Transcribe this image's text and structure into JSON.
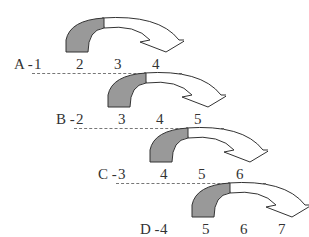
{
  "rows": [
    {
      "label": "A -",
      "numbers": [
        "1",
        "2",
        "3",
        "4"
      ]
    },
    {
      "label": "B -",
      "numbers": [
        "2",
        "3",
        "4",
        "5"
      ]
    },
    {
      "label": "C -",
      "numbers": [
        "3",
        "4",
        "5",
        "6"
      ]
    },
    {
      "label": "D -",
      "numbers": [
        "4",
        "5",
        "6",
        "7"
      ]
    }
  ],
  "colors": {
    "arc_fill": "#999999",
    "stroke": "#333333"
  }
}
